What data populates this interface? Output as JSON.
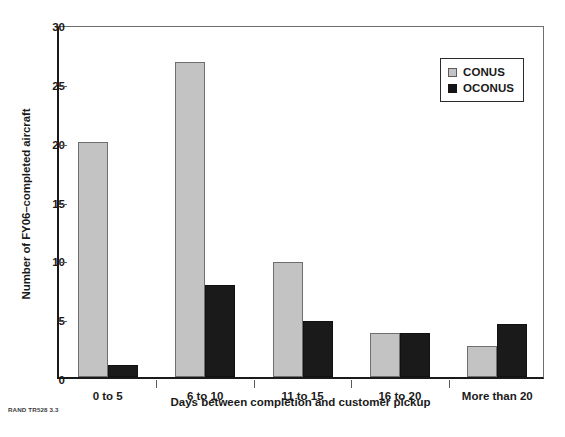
{
  "chart_data": {
    "type": "bar",
    "title": "",
    "xlabel": "Days between completion and customer pickup",
    "ylabel": "Number of FY06–completed aircraft",
    "categories": [
      "0 to 5",
      "6 to 10",
      "11 to 15",
      "16 to 20",
      "More than 20"
    ],
    "series": [
      {
        "name": "CONUS",
        "color": "#c3c3c3",
        "values": [
          20,
          26.8,
          9.8,
          3.7,
          2.6
        ]
      },
      {
        "name": "OCONUS",
        "color": "#1a1a1a",
        "values": [
          1,
          7.8,
          4.8,
          3.7,
          4.5
        ]
      }
    ],
    "ylim": [
      0,
      30
    ],
    "yticks": [
      0,
      5,
      10,
      15,
      20,
      25,
      30
    ],
    "grid": false,
    "legend_position": "top-right"
  },
  "legend": {
    "items": [
      {
        "label": "CONUS",
        "swatch": "conus"
      },
      {
        "label": "OCONUS",
        "swatch": "oconus"
      }
    ]
  },
  "credit": "RAND TR528 3.3"
}
